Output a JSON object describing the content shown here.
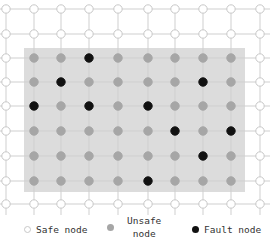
{
  "chart_data": {
    "type": "grid-mesh-diagram",
    "rows": 9,
    "cols": 10,
    "col_x": [
      6,
      34,
      61,
      89,
      118,
      148,
      175,
      203,
      231,
      260
    ],
    "row_y": [
      9,
      34,
      58,
      82,
      106,
      131,
      156,
      181,
      204
    ],
    "unsafe_region": {
      "x": 24,
      "y": 48,
      "width": 221,
      "height": 144,
      "color": "#dcdcdc"
    },
    "grid": [
      "SSSSSSSSSS",
      "SSSSSSSSSS",
      "SUUFUUUUUS",
      "SUFUUUUFUS",
      "SFUFUFUUUS",
      "SUUUUUFUFS",
      "SUUUUUUFUS",
      "SUUUUFUUUS",
      "SSSSSSSSSS"
    ],
    "node_types": {
      "S": {
        "label": "Safe node",
        "fill": "#ffffff",
        "stroke": "#c8c8c8"
      },
      "U": {
        "label": "Unsafe node",
        "fill": "#a6a6a6",
        "stroke": "#a6a6a6"
      },
      "F": {
        "label": "Fault node",
        "fill": "#111111",
        "stroke": "#111111"
      }
    },
    "edge_color": "#cfcfcf"
  },
  "legend": {
    "safe": "Safe node",
    "unsafe_line1": "Unsafe",
    "unsafe_line2": "node",
    "fault": "Fault node"
  }
}
